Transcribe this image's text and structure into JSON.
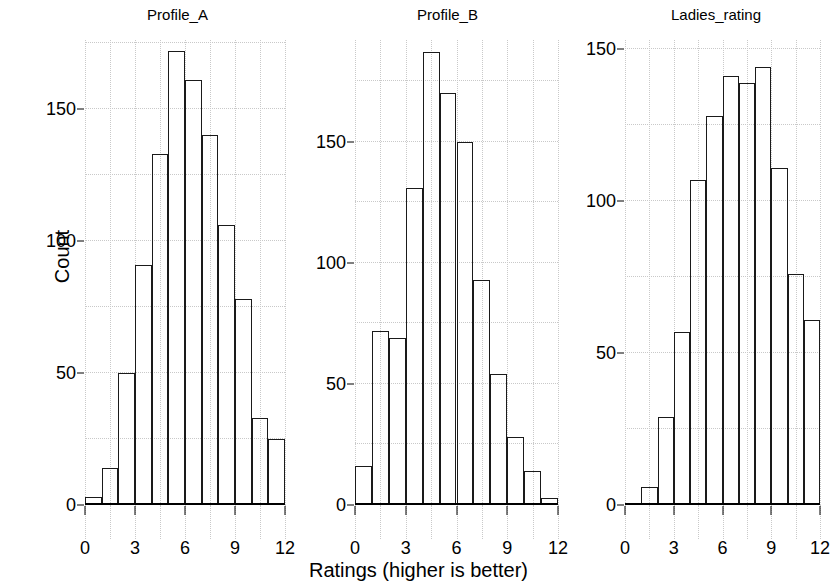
{
  "figure": {
    "ylabel": "Count",
    "xlabel": "Ratings (higher is better)"
  },
  "chart_data": [
    {
      "type": "bar",
      "title": "Profile_A",
      "xlabel": "Ratings (higher is better)",
      "ylabel": "Count",
      "categories": [
        "0",
        "1",
        "2",
        "3",
        "4",
        "5",
        "6",
        "7",
        "8",
        "9",
        "10",
        "11"
      ],
      "bin_edges": [
        0,
        1,
        2,
        3,
        4,
        5,
        6,
        7,
        8,
        9,
        10,
        11,
        12
      ],
      "values": [
        3,
        14,
        50,
        91,
        133,
        172,
        161,
        140,
        106,
        78,
        33,
        25
      ],
      "xlim": [
        0,
        12
      ],
      "ylim": [
        0,
        172
      ],
      "xticks": [
        "0",
        "3",
        "6",
        "9",
        "12"
      ],
      "yticks": [
        "0",
        "50",
        "100",
        "150"
      ],
      "grid": true,
      "legend": "none"
    },
    {
      "type": "bar",
      "title": "Profile_B",
      "xlabel": "Ratings (higher is better)",
      "ylabel": "Count",
      "categories": [
        "0",
        "1",
        "2",
        "3",
        "4",
        "5",
        "6",
        "7",
        "8",
        "9",
        "10",
        "11"
      ],
      "bin_edges": [
        0,
        1,
        2,
        3,
        4,
        5,
        6,
        7,
        8,
        9,
        10,
        11,
        12
      ],
      "values": [
        16,
        72,
        69,
        131,
        187,
        170,
        150,
        93,
        54,
        28,
        14,
        3
      ],
      "xlim": [
        0,
        12
      ],
      "ylim": [
        0,
        187
      ],
      "xticks": [
        "0",
        "3",
        "6",
        "9",
        "12"
      ],
      "yticks": [
        "0",
        "50",
        "100",
        "150"
      ],
      "grid": true,
      "legend": "none"
    },
    {
      "type": "bar",
      "title": "Ladies_rating",
      "xlabel": "Ratings (higher is better)",
      "ylabel": "Count",
      "categories": [
        "1",
        "2",
        "3",
        "4",
        "5",
        "6",
        "7",
        "8",
        "9",
        "10",
        "11"
      ],
      "bin_edges": [
        1,
        2,
        3,
        4,
        5,
        6,
        7,
        8,
        9,
        10,
        11,
        12
      ],
      "values": [
        6,
        29,
        57,
        107,
        128,
        141,
        139,
        144,
        111,
        76,
        61
      ],
      "xlim": [
        0,
        12
      ],
      "ylim": [
        0,
        150
      ],
      "xticks": [
        "0",
        "3",
        "6",
        "9",
        "12"
      ],
      "yticks": [
        "0",
        "50",
        "100",
        "150"
      ],
      "grid": true,
      "legend": "none"
    }
  ],
  "panels": [
    {
      "title": "Profile_A",
      "yticks": [
        {
          "label": "150",
          "value": 150
        },
        {
          "label": "100",
          "value": 100
        },
        {
          "label": "50",
          "value": 50
        },
        {
          "label": "0",
          "value": 0
        }
      ],
      "xticks": [
        {
          "label": "0",
          "value": 0
        },
        {
          "label": "3",
          "value": 3
        },
        {
          "label": "6",
          "value": 6
        },
        {
          "label": "9",
          "value": 9
        },
        {
          "label": "12",
          "value": 12
        }
      ]
    },
    {
      "title": "Profile_B",
      "yticks": [
        {
          "label": "150",
          "value": 150
        },
        {
          "label": "100",
          "value": 100
        },
        {
          "label": "50",
          "value": 50
        },
        {
          "label": "0",
          "value": 0
        }
      ],
      "xticks": [
        {
          "label": "0",
          "value": 0
        },
        {
          "label": "3",
          "value": 3
        },
        {
          "label": "6",
          "value": 6
        },
        {
          "label": "9",
          "value": 9
        },
        {
          "label": "12",
          "value": 12
        }
      ]
    },
    {
      "title": "Ladies_rating",
      "yticks": [
        {
          "label": "150",
          "value": 150
        },
        {
          "label": "100",
          "value": 100
        },
        {
          "label": "50",
          "value": 50
        },
        {
          "label": "0",
          "value": 0
        }
      ],
      "xticks": [
        {
          "label": "0",
          "value": 0
        },
        {
          "label": "3",
          "value": 3
        },
        {
          "label": "6",
          "value": 6
        },
        {
          "label": "9",
          "value": 9
        },
        {
          "label": "12",
          "value": 12
        }
      ]
    }
  ],
  "style": {
    "bar_edge_color": "#1a1a1a",
    "bar_fill_color": "#ffffff",
    "grid_color": "#c9c9c9",
    "axis_color": "#000000",
    "background": "#ffffff"
  }
}
